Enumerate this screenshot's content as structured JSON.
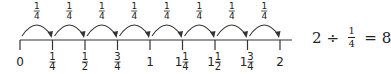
{
  "diagram": {
    "type": "number-line",
    "range": [
      0,
      2
    ],
    "step": "1/4",
    "jump_label": {
      "whole": "",
      "num": "1",
      "den": "4"
    },
    "jump_count": 8,
    "ticks": [
      {
        "whole": "0",
        "num": "",
        "den": ""
      },
      {
        "whole": "",
        "num": "1",
        "den": "4"
      },
      {
        "whole": "",
        "num": "1",
        "den": "2"
      },
      {
        "whole": "",
        "num": "3",
        "den": "4"
      },
      {
        "whole": "1",
        "num": "",
        "den": ""
      },
      {
        "whole": "1",
        "num": "1",
        "den": "4"
      },
      {
        "whole": "1",
        "num": "1",
        "den": "2"
      },
      {
        "whole": "1",
        "num": "3",
        "den": "4"
      },
      {
        "whole": "2",
        "num": "",
        "den": ""
      }
    ],
    "colors": {
      "line": "#333333",
      "text": "#222222"
    }
  },
  "equation": {
    "dividend": "2",
    "operator": "÷",
    "divisor_num": "1",
    "divisor_den": "4",
    "equals": "=",
    "result": "8"
  }
}
